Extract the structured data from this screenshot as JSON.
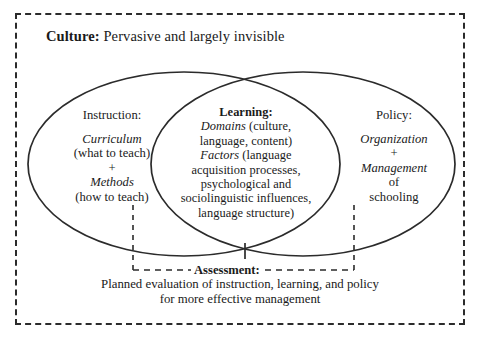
{
  "figure": {
    "type": "venn-diagram",
    "background_color": "#ffffff",
    "line_color": "#2b2b2b"
  },
  "culture": {
    "label_bold": "Culture:",
    "label_rest": " Pervasive and largely invisible"
  },
  "instruction": {
    "title": "Instruction:",
    "line1_italic": "Curriculum",
    "line2": "(what to teach)",
    "line3_plus": "+",
    "line4_italic": "Methods",
    "line5": "(how to teach)"
  },
  "learning": {
    "title": "Learning:",
    "line1_italic": "Domains",
    "line1_rest": " (culture,",
    "line2": "language, content)",
    "line3_italic": "Factors",
    "line3_rest": " (language",
    "line4": "acquisition processes,",
    "line5": "psychological and",
    "line6": "sociolinguistic influences,",
    "line7": "language structure)"
  },
  "policy": {
    "title": "Policy:",
    "line1_italic": "Organization",
    "line2_plus": "+",
    "line3_italic": "Management",
    "line4": "of",
    "line5": "schooling"
  },
  "assessment": {
    "label": "Assessment:",
    "line1": "Planned evaluation of instruction, learning, and policy",
    "line2": "for more effective management"
  }
}
